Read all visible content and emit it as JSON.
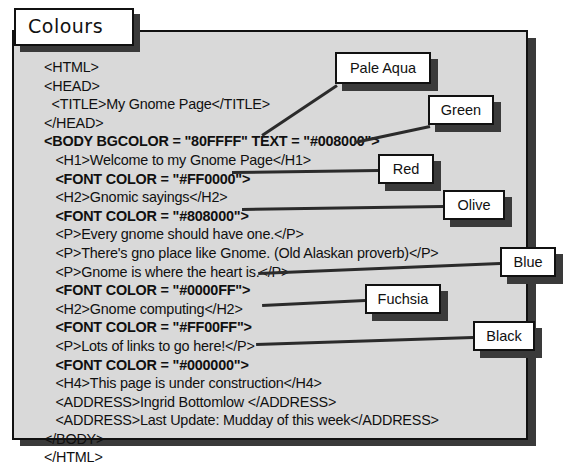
{
  "figure": {
    "tab_title": "Colours"
  },
  "code": {
    "lines": [
      {
        "text": "<HTML>",
        "indent": 0,
        "bold": false
      },
      {
        "text": "<HEAD>",
        "indent": 0,
        "bold": false
      },
      {
        "text": "  <TITLE>My Gnome Page</TITLE>",
        "indent": 0,
        "bold": false
      },
      {
        "text": "</HEAD>",
        "indent": 0,
        "bold": false
      },
      {
        "text": "<BODY BGCOLOR = \"80FFFF\" TEXT = \"#008000\">",
        "indent": 0,
        "bold": true
      },
      {
        "text": "   <H1>Welcome to my Gnome Page</H1>",
        "indent": 0,
        "bold": false
      },
      {
        "text": "   <FONT COLOR = \"#FF0000\">",
        "indent": 0,
        "bold": true
      },
      {
        "text": "   <H2>Gnomic sayings</H2>",
        "indent": 0,
        "bold": false
      },
      {
        "text": "   <FONT COLOR = \"#808000\">",
        "indent": 0,
        "bold": true
      },
      {
        "text": "   <P>Every gnome should have one.</P>",
        "indent": 0,
        "bold": false
      },
      {
        "text": "   <P>There's gno place like Gnome. (Old Alaskan proverb)</P>",
        "indent": 0,
        "bold": false
      },
      {
        "text": "   <P>Gnome is where the heart is.</P>",
        "indent": 0,
        "bold": false
      },
      {
        "text": "   <FONT COLOR = \"#0000FF\">",
        "indent": 0,
        "bold": true
      },
      {
        "text": "   <H2>Gnome computing</H2>",
        "indent": 0,
        "bold": false
      },
      {
        "text": "   <FONT COLOR = \"#FF00FF\">",
        "indent": 0,
        "bold": true
      },
      {
        "text": "   <P>Lots of links to go here!</P>",
        "indent": 0,
        "bold": false
      },
      {
        "text": "   <FONT COLOR = \"#000000\">",
        "indent": 0,
        "bold": true
      },
      {
        "text": "   <H4>This page is under construction</H4>",
        "indent": 0,
        "bold": false
      },
      {
        "text": "   <ADDRESS>Ingrid Bottomlow </ADDRESS>",
        "indent": 0,
        "bold": false
      },
      {
        "text": "   <ADDRESS>Last Update: Mudday of this week</ADDRESS>",
        "indent": 0,
        "bold": false
      },
      {
        "text": "</BODY>",
        "indent": 0,
        "bold": false
      },
      {
        "text": "</HTML>",
        "indent": 0,
        "bold": false
      }
    ]
  },
  "callouts": [
    {
      "label": "Pale Aqua",
      "color_hex": "#80FFFF",
      "refers_to": "BGCOLOR = \"80FFFF\""
    },
    {
      "label": "Green",
      "color_hex": "#008000",
      "refers_to": "TEXT = \"#008000\""
    },
    {
      "label": "Red",
      "color_hex": "#FF0000",
      "refers_to": "FONT COLOR = \"#FF0000\""
    },
    {
      "label": "Olive",
      "color_hex": "#808000",
      "refers_to": "FONT COLOR = \"#808000\""
    },
    {
      "label": "Blue",
      "color_hex": "#0000FF",
      "refers_to": "FONT COLOR = \"#0000FF\""
    },
    {
      "label": "Fuchsia",
      "color_hex": "#FF00FF",
      "refers_to": "FONT COLOR = \"#FF00FF\""
    },
    {
      "label": "Black",
      "color_hex": "#000000",
      "refers_to": "FONT COLOR = \"#000000\""
    }
  ]
}
